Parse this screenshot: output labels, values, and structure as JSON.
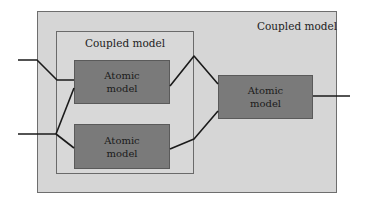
{
  "diagram": {
    "outer_coupled_model": {
      "label": "Coupled model"
    },
    "inner_coupled_model": {
      "label": "Coupled model"
    },
    "atomic_models": [
      {
        "id": "a1",
        "label_line1": "Atomic",
        "label_line2": "model"
      },
      {
        "id": "a2",
        "label_line1": "Atomic",
        "label_line2": "model"
      },
      {
        "id": "a3",
        "label_line1": "Atomic",
        "label_line2": "model"
      }
    ],
    "connections": [
      {
        "from": "input-1",
        "to": "a1"
      },
      {
        "from": "input-2",
        "to": "a1"
      },
      {
        "from": "input-2",
        "to": "a2"
      },
      {
        "from": "a1",
        "to": "a3"
      },
      {
        "from": "a2",
        "to": "a3"
      },
      {
        "from": "a3",
        "to": "output"
      }
    ],
    "colors": {
      "outer_fill": "#d6d6d6",
      "inner_fill": "#d8d8d8",
      "atomic_fill": "#7a7a7a",
      "wire": "#1a1a1a"
    }
  }
}
